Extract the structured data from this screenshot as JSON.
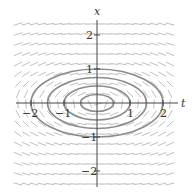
{
  "figure": {
    "type": "slope-field",
    "axes": {
      "horizontal_label": "t",
      "vertical_label": "x",
      "t_ticks": [
        {
          "value": -2,
          "label": "−2"
        },
        {
          "value": -1,
          "label": "−1"
        },
        {
          "value": 1,
          "label": "1"
        },
        {
          "value": 2,
          "label": "2"
        }
      ],
      "x_ticks": [
        {
          "value": 2,
          "label": "2"
        },
        {
          "value": 1,
          "label": "1"
        },
        {
          "value": -1,
          "label": "−1"
        },
        {
          "value": -2,
          "label": "−2"
        }
      ],
      "t_range": [
        -2.5,
        2.5
      ],
      "x_range": [
        -2.5,
        2.5
      ]
    },
    "solution_curves": [
      {
        "semi_t": 2.0,
        "semi_x": 1.0
      },
      {
        "semi_t": 1.5,
        "semi_x": 0.75
      },
      {
        "semi_t": 1.0,
        "semi_x": 0.5
      },
      {
        "semi_t": 0.5,
        "semi_x": 0.25
      }
    ],
    "colors": {
      "axis": "#444444",
      "field": "#b8b8b8",
      "curve": "#8c8c8c",
      "text": "#333333"
    }
  }
}
